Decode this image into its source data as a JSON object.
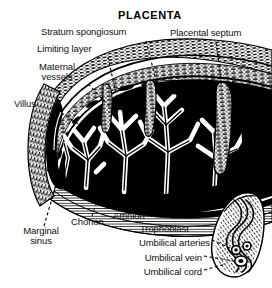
{
  "figure": {
    "title": "PLACENTA",
    "background_color": "#ffffff",
    "ink_color": "#000000",
    "width": 272,
    "height": 288
  },
  "labels": {
    "stratum_spongiosum": "Stratum spongiosum",
    "limiting_layer": "Limiting layer",
    "maternal_vessels_line1": "Maternal",
    "maternal_vessels_line2": "vessels",
    "villus": "Villus",
    "placental_septum": "Placental septum",
    "marginal_sinus_line1": "Marginal",
    "marginal_sinus_line2": "sinus",
    "chorion": "Chorion",
    "amnion": "Amnion",
    "trophoblast": "Trophoblast",
    "umbilical_arteries": "Umbilical arteries",
    "umbilical_vein": "Umbilical vein",
    "umbilical_cord": "Umbilical cord"
  },
  "structures": [
    {
      "name": "decidua-basalis",
      "description": "hatched maternal layer along upper arc"
    },
    {
      "name": "intervillous-space",
      "description": "black blood-filled space"
    },
    {
      "name": "chorionic-villi",
      "description": "white branching villous trees"
    },
    {
      "name": "placental-septum",
      "description": "vertical wedge dividing cotyledons"
    },
    {
      "name": "chorionic-plate",
      "description": "layered band below intervillous space"
    },
    {
      "name": "umbilical-cord",
      "description": "twisted cord at right with spiral vessels"
    },
    {
      "name": "marginal-sinus",
      "description": "venous channel at placental margin"
    }
  ]
}
